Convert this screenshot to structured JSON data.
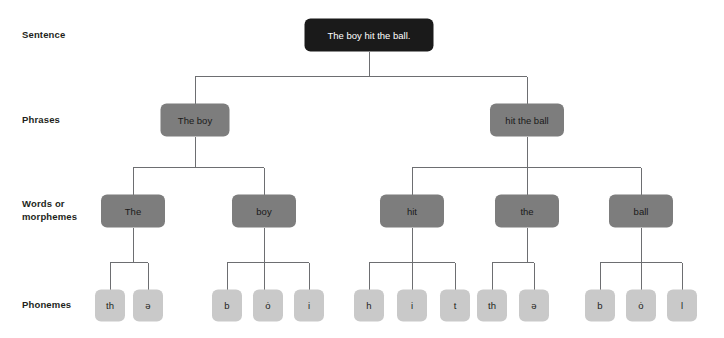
{
  "diagram": {
    "colors": {
      "sentence_fill": "#1a1a1a",
      "phrase_fill": "#7d7d7d",
      "word_fill": "#7d7d7d",
      "phoneme_fill": "#c9c9c9",
      "connector": "#6d6e71",
      "background": "#ffffff",
      "dark_text": "#231f20",
      "light_text": "#ffffff"
    },
    "row_labels": [
      {
        "id": "sentence",
        "label": "Sentence"
      },
      {
        "id": "phrases",
        "label": "Phrases"
      },
      {
        "id": "words",
        "label": "Words or",
        "label2": "morphemes"
      },
      {
        "id": "phonemes",
        "label": "Phonemes"
      }
    ],
    "levels": {
      "sentence": {
        "nodes": [
          {
            "id": "s1",
            "text": "The boy hit the ball.",
            "cx": 369,
            "cy": 35,
            "w": 129,
            "h": 33
          }
        ]
      },
      "phrases": {
        "nodes": [
          {
            "id": "p1",
            "text": "The boy",
            "cx": 195,
            "cy": 120,
            "w": 69,
            "h": 33
          },
          {
            "id": "p2",
            "text": "hit the ball",
            "cx": 527,
            "cy": 120,
            "w": 74,
            "h": 33
          }
        ]
      },
      "words": {
        "nodes": [
          {
            "id": "w1",
            "text": "The",
            "cx": 133,
            "cy": 211,
            "w": 64,
            "h": 33
          },
          {
            "id": "w2",
            "text": "boy",
            "cx": 264,
            "cy": 211,
            "w": 64,
            "h": 33
          },
          {
            "id": "w3",
            "text": "hit",
            "cx": 412,
            "cy": 211,
            "w": 64,
            "h": 33
          },
          {
            "id": "w4",
            "text": "the",
            "cx": 527,
            "cy": 211,
            "w": 64,
            "h": 33
          },
          {
            "id": "w5",
            "text": "ball",
            "cx": 641,
            "cy": 211,
            "w": 64,
            "h": 33
          }
        ]
      },
      "phonemes": {
        "nodes": [
          {
            "id": "ph1",
            "text": "th",
            "cx": 110,
            "cy": 305,
            "w": 30,
            "h": 32
          },
          {
            "id": "ph2",
            "text": "ə",
            "cx": 148,
            "cy": 305,
            "w": 30,
            "h": 32
          },
          {
            "id": "ph3",
            "text": "b",
            "cx": 227,
            "cy": 305,
            "w": 30,
            "h": 32
          },
          {
            "id": "ph4",
            "text": "ȯ",
            "cx": 268,
            "cy": 305,
            "w": 30,
            "h": 32
          },
          {
            "id": "ph5",
            "text": "i",
            "cx": 309,
            "cy": 305,
            "w": 30,
            "h": 32
          },
          {
            "id": "ph6",
            "text": "h",
            "cx": 369,
            "cy": 305,
            "w": 30,
            "h": 32
          },
          {
            "id": "ph7",
            "text": "i",
            "cx": 412,
            "cy": 305,
            "w": 30,
            "h": 32
          },
          {
            "id": "ph8",
            "text": "t",
            "cx": 455,
            "cy": 305,
            "w": 30,
            "h": 32
          },
          {
            "id": "ph9",
            "text": "th",
            "cx": 492,
            "cy": 305,
            "w": 30,
            "h": 32
          },
          {
            "id": "ph10",
            "text": "ə",
            "cx": 534,
            "cy": 305,
            "w": 30,
            "h": 32
          },
          {
            "id": "ph11",
            "text": "b",
            "cx": 600,
            "cy": 305,
            "w": 30,
            "h": 32
          },
          {
            "id": "ph12",
            "text": "ȯ",
            "cx": 641,
            "cy": 305,
            "w": 30,
            "h": 32
          },
          {
            "id": "ph13",
            "text": "l",
            "cx": 682,
            "cy": 305,
            "w": 30,
            "h": 32
          }
        ]
      }
    }
  }
}
